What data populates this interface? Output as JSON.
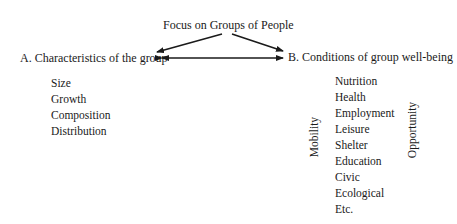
{
  "diagram": {
    "root": "Focus on Groups of People",
    "node_a": "A. Characteristics of the group",
    "node_b": "B. Conditions of group well-being",
    "characteristics": [
      "Size",
      "Growth",
      "Composition",
      "Distribution"
    ],
    "conditions": [
      "Nutrition",
      "Health",
      "Employment",
      "Leisure",
      "Shelter",
      "Education",
      "Civic",
      "Ecological",
      "Etc."
    ],
    "side_label_left": "Mobility",
    "side_label_right": "Opportunity"
  }
}
